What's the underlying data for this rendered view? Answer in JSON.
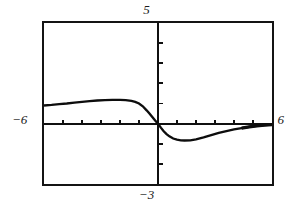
{
  "screen": {
    "kind": "graphing-calculator-screen",
    "background_color": "#ffffff",
    "frame_color": "#141414",
    "curve_color": "#0d0d0d"
  },
  "labels": {
    "ymax": "5",
    "ymin": "−3",
    "xmin": "−6",
    "xmax": "6"
  },
  "chart_data": {
    "type": "line",
    "title": "",
    "xlabel": "",
    "ylabel": "",
    "xlim": [
      -6,
      6
    ],
    "ylim": [
      -3,
      5
    ],
    "grid": false,
    "legend": "none",
    "axes": {
      "x_axis_at_y": 0,
      "y_axis_at_x": 0,
      "x_tick_step": 1,
      "y_tick_step": 1,
      "x_ticks": [
        -5,
        -4,
        -3,
        -2,
        -1,
        1,
        2,
        3,
        4,
        5
      ],
      "y_ticks": [
        -2,
        -1,
        1,
        2,
        3,
        4
      ]
    },
    "series": [
      {
        "name": "curve",
        "x": [
          -6.0,
          -5.6,
          -5.2,
          -4.8,
          -4.4,
          -4.0,
          -3.6,
          -3.2,
          -2.8,
          -2.4,
          -2.0,
          -1.7,
          -1.4,
          -1.2,
          -1.0,
          -0.8,
          -0.6,
          -0.45,
          -0.3,
          -0.15,
          0.0,
          0.15,
          0.3,
          0.45,
          0.6,
          0.8,
          1.0,
          1.2,
          1.4,
          1.7,
          2.0,
          2.4,
          2.8,
          3.2,
          3.6,
          4.0,
          4.4,
          4.8,
          5.2,
          5.6,
          6.0
        ],
        "y": [
          0.9,
          0.93,
          0.97,
          1.0,
          1.04,
          1.08,
          1.12,
          1.15,
          1.17,
          1.18,
          1.18,
          1.17,
          1.13,
          1.08,
          1.0,
          0.86,
          0.66,
          0.5,
          0.33,
          0.16,
          0.0,
          -0.2,
          -0.38,
          -0.52,
          -0.63,
          -0.74,
          -0.8,
          -0.83,
          -0.84,
          -0.83,
          -0.78,
          -0.68,
          -0.57,
          -0.46,
          -0.37,
          -0.29,
          -0.22,
          -0.16,
          -0.11,
          -0.07,
          -0.05
        ]
      }
    ]
  }
}
